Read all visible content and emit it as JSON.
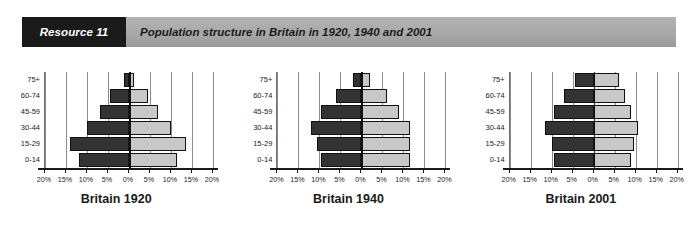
{
  "banner": {
    "tag": "Resource 11",
    "title": "Population structure in Britain in 1920, 1940 and 2001",
    "tag_bg": "#1a1a1a",
    "bar_bg": "#a8a8a8"
  },
  "chart_data": [
    {
      "type": "bar",
      "title": "Britain 1920",
      "orientation": "population-pyramid",
      "categories": [
        "0-14",
        "15-29",
        "30-44",
        "45-59",
        "60-74",
        "75+"
      ],
      "series": [
        {
          "name": "Male",
          "side": "left",
          "color": "#333333",
          "values": [
            12.0,
            14.0,
            10.0,
            7.0,
            4.5,
            1.2
          ]
        },
        {
          "name": "Female",
          "side": "right",
          "color": "#c8c8c8",
          "values": [
            11.5,
            13.5,
            10.0,
            7.0,
            4.5,
            1.2
          ]
        }
      ],
      "xlabel": "",
      "ylabel": "",
      "xlim": [
        -20,
        20
      ],
      "xticks": [
        -20,
        -15,
        -10,
        -5,
        0,
        5,
        10,
        15,
        20
      ],
      "xticklabels": [
        "20%",
        "15%",
        "10%",
        "5%",
        "0%",
        "5%",
        "10%",
        "15%",
        "20%"
      ],
      "grid": true,
      "legend": "none"
    },
    {
      "type": "bar",
      "title": "Britain 1940",
      "orientation": "population-pyramid",
      "categories": [
        "0-14",
        "15-29",
        "30-44",
        "45-59",
        "60-74",
        "75+"
      ],
      "series": [
        {
          "name": "Male",
          "side": "left",
          "color": "#333333",
          "values": [
            9.5,
            10.5,
            12.0,
            9.5,
            6.0,
            2.0
          ]
        },
        {
          "name": "Female",
          "side": "right",
          "color": "#c8c8c8",
          "values": [
            11.5,
            11.5,
            11.5,
            9.0,
            6.0,
            2.0
          ]
        }
      ],
      "xlabel": "",
      "ylabel": "",
      "xlim": [
        -20,
        20
      ],
      "xticks": [
        -20,
        -15,
        -10,
        -5,
        0,
        5,
        10,
        15,
        20
      ],
      "xticklabels": [
        "20%",
        "15%",
        "10%",
        "5%",
        "0%",
        "5%",
        "10%",
        "15%",
        "20%"
      ],
      "grid": true,
      "legend": "none"
    },
    {
      "type": "bar",
      "title": "Britain 2001",
      "orientation": "population-pyramid",
      "categories": [
        "0-14",
        "15-29",
        "30-44",
        "45-59",
        "60-74",
        "75+"
      ],
      "series": [
        {
          "name": "Male",
          "side": "left",
          "color": "#333333",
          "values": [
            9.5,
            10.0,
            11.5,
            9.5,
            7.0,
            4.5
          ]
        },
        {
          "name": "Female",
          "side": "right",
          "color": "#c8c8c8",
          "values": [
            9.0,
            9.5,
            10.5,
            9.0,
            7.5,
            6.0
          ]
        }
      ],
      "xlabel": "",
      "ylabel": "",
      "xlim": [
        -20,
        20
      ],
      "xticks": [
        -20,
        -15,
        -10,
        -5,
        0,
        5,
        10,
        15,
        20
      ],
      "xticklabels": [
        "20%",
        "15%",
        "10%",
        "5%",
        "0%",
        "5%",
        "10%",
        "15%",
        "20%"
      ],
      "grid": true,
      "legend": "none"
    }
  ]
}
